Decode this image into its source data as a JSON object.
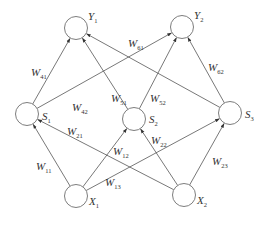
{
  "diagram": {
    "type": "neural-network",
    "nodes": [
      {
        "id": "Y1",
        "label": "Y",
        "sub": "1",
        "layer": "output",
        "cx": 76,
        "cy": 28
      },
      {
        "id": "Y2",
        "label": "Y",
        "sub": "2",
        "layer": "output",
        "cx": 182,
        "cy": 27
      },
      {
        "id": "S1",
        "label": "S",
        "sub": "1",
        "layer": "hidden",
        "cx": 27,
        "cy": 114
      },
      {
        "id": "S2",
        "label": "S",
        "sub": "2",
        "layer": "hidden",
        "cx": 134,
        "cy": 119
      },
      {
        "id": "S3",
        "label": "S",
        "sub": "3",
        "layer": "hidden",
        "cx": 230,
        "cy": 113
      },
      {
        "id": "X1",
        "label": "X",
        "sub": "1",
        "layer": "input",
        "cx": 76,
        "cy": 196
      },
      {
        "id": "X2",
        "label": "X",
        "sub": "2",
        "layer": "input",
        "cx": 184,
        "cy": 195
      }
    ],
    "edges": [
      {
        "from": "X1",
        "to": "S1",
        "label": "W",
        "sub": "11"
      },
      {
        "from": "X1",
        "to": "S2",
        "label": "W",
        "sub": "12"
      },
      {
        "from": "X1",
        "to": "S3",
        "label": "W",
        "sub": "13"
      },
      {
        "from": "X2",
        "to": "S1",
        "label": "W",
        "sub": "21"
      },
      {
        "from": "X2",
        "to": "S2",
        "label": "W",
        "sub": "22"
      },
      {
        "from": "X2",
        "to": "S3",
        "label": "W",
        "sub": "23"
      },
      {
        "from": "S1",
        "to": "Y1",
        "label": "W",
        "sub": "41"
      },
      {
        "from": "S1",
        "to": "Y2",
        "label": "W",
        "sub": "42"
      },
      {
        "from": "S2",
        "to": "Y1",
        "label": "W",
        "sub": "51"
      },
      {
        "from": "S2",
        "to": "Y2",
        "label": "W",
        "sub": "52"
      },
      {
        "from": "S3",
        "to": "Y1",
        "label": "W",
        "sub": "61"
      },
      {
        "from": "S3",
        "to": "Y2",
        "label": "W",
        "sub": "62"
      }
    ],
    "edge_label_positions": {
      "11": [
        36,
        170
      ],
      "12": [
        113,
        155
      ],
      "13": [
        105,
        186
      ],
      "21": [
        67,
        135
      ],
      "22": [
        151,
        144
      ],
      "23": [
        212,
        165
      ],
      "41": [
        31,
        76
      ],
      "42": [
        72,
        111
      ],
      "51": [
        111,
        102
      ],
      "52": [
        150,
        102
      ],
      "61": [
        128,
        47
      ],
      "62": [
        208,
        71
      ]
    },
    "node_label_offsets": {
      "Y1": [
        12,
        -8
      ],
      "Y2": [
        12,
        -8
      ],
      "S1": [
        15,
        6
      ],
      "S2": [
        15,
        4
      ],
      "S3": [
        15,
        5
      ],
      "X1": [
        13,
        9
      ],
      "X2": [
        13,
        9
      ]
    },
    "colors": {
      "stroke": "#555555",
      "node_stroke": "#6e6e6e",
      "text": "#333333",
      "background": "#ffffff"
    },
    "node_radius": 11.5
  }
}
